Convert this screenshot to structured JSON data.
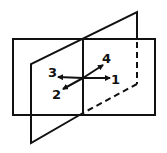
{
  "diagram": {
    "stroke_color": "#111111",
    "background": "#ffffff",
    "labels": [
      {
        "id": "1",
        "text": "1",
        "x": 111,
        "y": 84
      },
      {
        "id": "2",
        "text": "2",
        "x": 52,
        "y": 99
      },
      {
        "id": "3",
        "text": "3",
        "x": 48,
        "y": 77
      },
      {
        "id": "4",
        "text": "4",
        "x": 102,
        "y": 63
      }
    ]
  }
}
